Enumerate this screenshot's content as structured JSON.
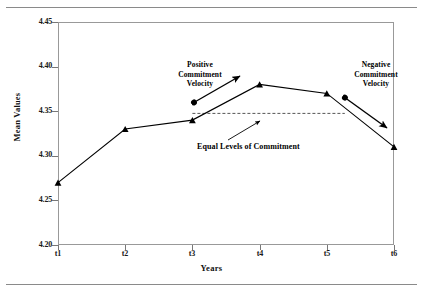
{
  "chart_data": {
    "type": "line",
    "title": "",
    "xlabel": "Years",
    "ylabel": "Mean Values",
    "categories": [
      "t1",
      "t2",
      "t3",
      "t4",
      "t5",
      "t6"
    ],
    "values": [
      4.27,
      4.33,
      4.34,
      4.38,
      4.37,
      4.31
    ],
    "series": [
      {
        "name": "Mean Values",
        "values": [
          4.27,
          4.33,
          4.34,
          4.38,
          4.37,
          4.31
        ],
        "marker": "triangle",
        "color": "#000000"
      }
    ],
    "ylim": [
      4.2,
      4.45
    ],
    "ytick_labels": [
      "4.45",
      "4.40",
      "4.35",
      "4.30",
      "4.25",
      "4.20"
    ],
    "ytick_values": [
      4.45,
      4.4,
      4.35,
      4.3,
      4.25,
      4.2
    ],
    "xtick_labels": [
      "t1",
      "t2",
      "t3",
      "t4",
      "t5",
      "t6"
    ],
    "grid": false,
    "legend": "none",
    "reference_line": {
      "label": "Equal Levels of Commitment",
      "value": 4.3475,
      "style": "dashed",
      "from_category": "t3",
      "to_category": "t5",
      "color": "#555555"
    },
    "annotations": [
      {
        "name": "positive-commitment-velocity",
        "lines": [
          "Positive",
          "Commitment",
          "Velocity"
        ],
        "text": "Positive Commitment Velocity",
        "arrow": "double-headed",
        "from_category": "t3",
        "to_category": "t4"
      },
      {
        "name": "negative-commitment-velocity",
        "lines": [
          "Negative",
          "Commitment",
          "Velocity"
        ],
        "text": "Negative Commitment Velocity",
        "arrow": "double-headed",
        "from_category": "t5",
        "to_category": "t6"
      },
      {
        "name": "equal-levels-of-commitment",
        "lines": [
          "Equal Levels of Commitment"
        ],
        "text": "Equal Levels of Commitment",
        "arrow": "single-headed-up-right",
        "points_to": "reference-line"
      }
    ]
  },
  "axes": {
    "y": {
      "title": "Mean Values",
      "ticks": [
        "4.45",
        "4.40",
        "4.35",
        "4.30",
        "4.25",
        "4.20"
      ]
    },
    "x": {
      "title": "Years",
      "ticks": [
        "t1",
        "t2",
        "t3",
        "t4",
        "t5",
        "t6"
      ]
    }
  },
  "annotations": {
    "positive_line1": "Positive",
    "positive_line2": "Commitment",
    "positive_line3": "Velocity",
    "negative_line1": "Negative",
    "negative_line2": "Commitment",
    "negative_line3": "Velocity",
    "equal_levels": "Equal Levels of Commitment"
  },
  "colors": {
    "series": "#000000",
    "frame": "#999999",
    "reference_line": "#555555",
    "text": "#111111",
    "page_rule": "#8a8a8a"
  }
}
